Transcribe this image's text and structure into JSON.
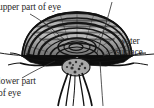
{
  "figure": {
    "style": "grayscale engraving / halftone line drawing",
    "background_color": "#ffffff",
    "ink_color": "#1a1a1a",
    "text_color": "#2b2b2b",
    "labels": {
      "upper_part_of_eye": "upper part of eye",
      "water_line1": "water",
      "water_line2": "surface",
      "lower_part_line1": "lower part",
      "lower_part_line2": "of eye"
    },
    "leader_lines": [
      {
        "name": "upper-eye-leader",
        "from": [
          30,
          14
        ],
        "to": [
          66,
          40
        ]
      },
      {
        "name": "water-surface-leader-top",
        "from": [
          112,
          2
        ],
        "to": [
          96,
          52
        ]
      },
      {
        "name": "water-surface-leader-right",
        "from": [
          118,
          50
        ],
        "to": [
          104,
          56
        ]
      },
      {
        "name": "lower-eye-leader",
        "from": [
          22,
          78
        ],
        "to": [
          56,
          60
        ]
      },
      {
        "name": "waterline-left",
        "from": [
          0,
          53
        ],
        "to": [
          36,
          56
        ]
      },
      {
        "name": "waterline-right",
        "from": [
          118,
          56
        ],
        "to": [
          154,
          54
        ]
      },
      {
        "name": "vertical-leader-bottom",
        "from": [
          100,
          62
        ],
        "to": [
          103,
          106
        ]
      }
    ],
    "parts": [
      {
        "name": "upper-eye-dome",
        "description": "concentric banded arcs above the waterline"
      },
      {
        "name": "lower-eye-wedge-left",
        "description": "solid dark wedge below the waterline, left"
      },
      {
        "name": "lower-eye-wedge-right",
        "description": "solid dark wedge below the waterline, right"
      },
      {
        "name": "body-underside",
        "description": "mottled central body between the legs"
      },
      {
        "name": "legs",
        "description": "paired legs radiating down and outward"
      }
    ]
  }
}
